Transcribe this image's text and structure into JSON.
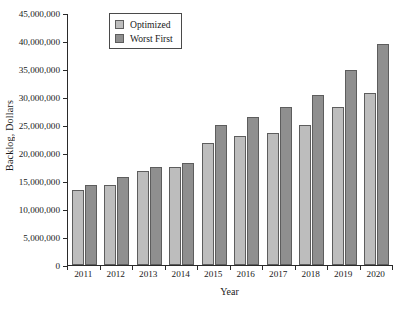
{
  "chart_data": {
    "type": "bar",
    "title": "",
    "xlabel": "Year",
    "ylabel": "Backlog, Dollars",
    "categories": [
      "2011",
      "2012",
      "2013",
      "2014",
      "2015",
      "2016",
      "2017",
      "2018",
      "2019",
      "2020"
    ],
    "series": [
      {
        "name": "Optimized",
        "color": "#bdbdbd",
        "values": [
          13500000,
          14300000,
          16800000,
          17600000,
          21900000,
          23100000,
          23600000,
          25100000,
          28300000,
          30800000
        ]
      },
      {
        "name": "Worst First",
        "color": "#8f8f8f",
        "values": [
          14400000,
          15700000,
          17600000,
          18300000,
          25100000,
          26500000,
          28300000,
          30400000,
          35000000,
          39600000
        ]
      }
    ],
    "ylim": [
      0,
      45000000
    ],
    "ytick_values": [
      0,
      5000000,
      10000000,
      15000000,
      20000000,
      25000000,
      30000000,
      35000000,
      40000000,
      45000000
    ],
    "ytick_labels": [
      "0",
      "5,000,000",
      "10,000,000",
      "15,000,000",
      "20,000,000",
      "25,000,000",
      "30,000,000",
      "35,000,000",
      "40,000,000",
      "45,000,000"
    ],
    "grid": false,
    "legend_position": "top-left"
  },
  "legend": {
    "entries": [
      {
        "label": "Optimized"
      },
      {
        "label": "Worst First"
      }
    ]
  }
}
